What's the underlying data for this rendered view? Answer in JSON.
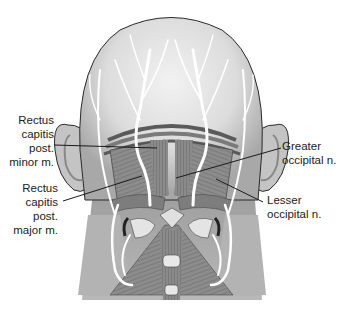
{
  "figure": {
    "colors": {
      "skin_light": "#e6e6e6",
      "skin_mid": "#c8c8c8",
      "skin_dark": "#a9a9a9",
      "muscle": "#8a8a8a",
      "muscle_dark": "#5a5a5a",
      "nerve": "#ffffff",
      "outline": "#2a2a2a",
      "leader": "#1a1a1a"
    }
  },
  "labels": {
    "rcp_minor": {
      "lines": [
        "Rectus",
        "capitis",
        "post.",
        "minor m."
      ]
    },
    "rcp_major": {
      "lines": [
        "Rectus",
        "capitis",
        "post.",
        "major m."
      ]
    },
    "greater_occipital": {
      "lines": [
        "Greater",
        "occipital n."
      ]
    },
    "lesser_occipital": {
      "lines": [
        "Lesser",
        "occipital n."
      ]
    }
  }
}
